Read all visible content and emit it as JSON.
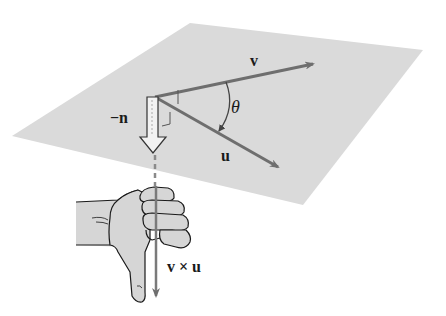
{
  "figure": {
    "type": "right-hand-rule cross product diagram",
    "labels": {
      "v": "v",
      "u": "u",
      "theta": "θ",
      "neg_n": "−n",
      "cross": "v × u"
    },
    "colors": {
      "plane": "#d9d9d9",
      "arrow": "#6e6e6e",
      "hand_fill": "#d6d6d6",
      "outline": "#1a1a1a",
      "text": "#1a1a1a"
    }
  }
}
